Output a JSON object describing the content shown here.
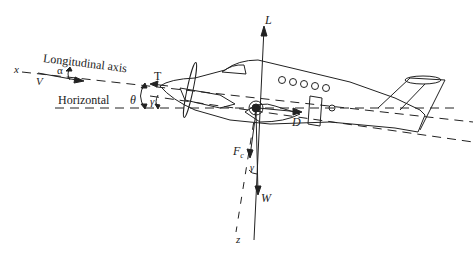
{
  "diagram": {
    "labels": {
      "longitudinal_axis": "Longitudinal axis",
      "horizontal": "Horizontal",
      "x_axis": "x",
      "z_axis": "z",
      "velocity": "V",
      "alpha": "α",
      "theta": "θ",
      "gamma_nose": "γ",
      "gamma_weight": "γ",
      "thrust": "T",
      "lift": "L",
      "drag": "D",
      "weight": "W",
      "centrifugal_force": "F",
      "centrifugal_subscript": "c"
    },
    "colors": {
      "ink": "#222222",
      "background": "#ffffff"
    }
  }
}
